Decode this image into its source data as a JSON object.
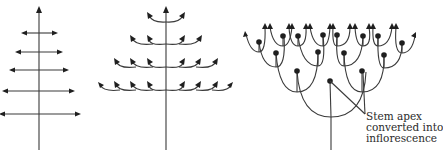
{
  "diagrams": [
    {
      "id": "monopodial",
      "description": "Single main stem with opposite straight lateral branches, arrows on every tip",
      "stem": {
        "x": 39,
        "top": 8,
        "bottom": 150
      },
      "branch_levels": [
        {
          "y": 33,
          "left": 22,
          "right": 57
        },
        {
          "y": 52,
          "left": 16,
          "right": 62
        },
        {
          "y": 70,
          "left": 10,
          "right": 68
        },
        {
          "y": 91,
          "left": 3,
          "right": 74
        },
        {
          "y": 114,
          "left": 0,
          "right": 80
        }
      ]
    },
    {
      "id": "branched-monopodial",
      "description": "Single main stem with curved arching laterals that re-branch, arrows on every tip",
      "stem": {
        "x": 166,
        "top": 8,
        "bottom": 150
      },
      "branch_levels": [
        {
          "y": 22,
          "left_tips": [
            148
          ],
          "right_tips": [
            184
          ]
        },
        {
          "y": 44,
          "left_tips": [
            131,
            149
          ],
          "right_tips": [
            183,
            200
          ]
        },
        {
          "y": 67,
          "left_tips": [
            115,
            132,
            149
          ],
          "right_tips": [
            183,
            199,
            216
          ]
        },
        {
          "y": 90,
          "left_tips": [
            100,
            115,
            132,
            149
          ],
          "right_tips": [
            183,
            199,
            216,
            231
          ]
        }
      ]
    },
    {
      "id": "sympodial",
      "description": "Repeated dichotomous branching; each apex terminates as a dot (converted into inflorescence)",
      "annotation": {
        "lines": [
          "Stem apex",
          "converted into",
          "inflorescence"
        ]
      }
    }
  ],
  "colors": {
    "line": "#3a3a3a",
    "node": "#1f1f1f",
    "background": "#ffffff"
  }
}
